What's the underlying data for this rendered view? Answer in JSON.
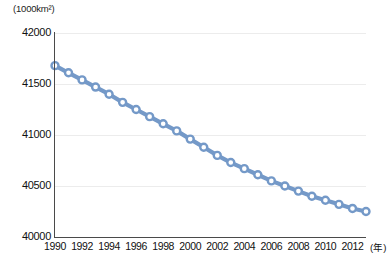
{
  "chart_data": {
    "type": "line",
    "title": "",
    "subtitle": "",
    "xlabel": "(年)",
    "ylabel": "(1000km²)",
    "y_unit_label": "(1000km²)",
    "x_unit_label": "(年)",
    "grid": true,
    "legend": "none",
    "ylim": [
      40000,
      42000
    ],
    "xlim": [
      1990,
      2013
    ],
    "y_ticks": [
      40000,
      40500,
      41000,
      41500,
      42000
    ],
    "x_ticks": [
      1990,
      1992,
      1994,
      1996,
      1998,
      2000,
      2002,
      2004,
      2006,
      2008,
      2010,
      2012
    ],
    "x": [
      1990,
      1991,
      1992,
      1993,
      1994,
      1995,
      1996,
      1997,
      1998,
      1999,
      2000,
      2001,
      2002,
      2003,
      2004,
      2005,
      2006,
      2007,
      2008,
      2009,
      2010,
      2011,
      2012,
      2013
    ],
    "values": [
      41680,
      41610,
      41540,
      41470,
      41400,
      41320,
      41250,
      41180,
      41110,
      41040,
      40960,
      40880,
      40800,
      40730,
      40670,
      40610,
      40550,
      40500,
      40450,
      40400,
      40360,
      40320,
      40280,
      40250
    ],
    "series": [
      {
        "name": "耕地面積",
        "color": "#7499c8",
        "marker": "open-circle",
        "values": [
          41680,
          41610,
          41540,
          41470,
          41400,
          41320,
          41250,
          41180,
          41110,
          41040,
          40960,
          40880,
          40800,
          40730,
          40670,
          40610,
          40550,
          40500,
          40450,
          40400,
          40360,
          40320,
          40280,
          40250
        ]
      }
    ]
  },
  "colors": {
    "series": "#7499c8",
    "axis": "#4a4a4a",
    "grid": "#ececec",
    "text": "#111111",
    "background": "#ffffff"
  }
}
